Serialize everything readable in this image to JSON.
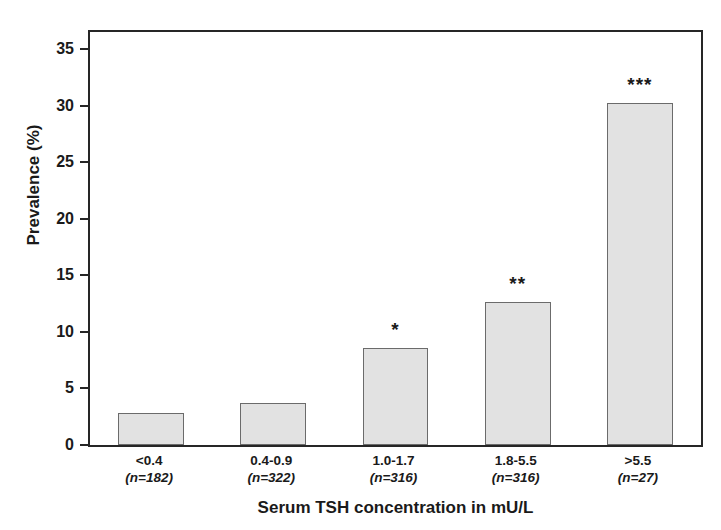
{
  "chart_data": {
    "type": "bar",
    "title": "",
    "xlabel": "Serum TSH concentration in mU/L",
    "ylabel": "Prevalence (%)",
    "categories": [
      "<0.4",
      "0.4-0.9",
      "1.0-1.7",
      "1.8-5.5",
      ">5.5"
    ],
    "group_sizes": [
      "(n=182)",
      "(n=322)",
      "(n=316)",
      "(n=316)",
      "(n=27)"
    ],
    "values": [
      2.8,
      3.7,
      8.6,
      12.6,
      30.2
    ],
    "annotations": [
      "",
      "",
      "*",
      "**",
      "***"
    ],
    "ylim": [
      0,
      36.5
    ],
    "yticks": [
      0,
      5,
      10,
      15,
      20,
      25,
      30,
      35
    ],
    "ytick_labels": [
      "0",
      "5",
      "10",
      "15",
      "20",
      "25",
      "30",
      "35"
    ],
    "grid": false,
    "legend": false,
    "bar_fill_color": "#e2e2e2",
    "bar_border_color": "#6b6b6b",
    "axis_color": "#262626"
  }
}
